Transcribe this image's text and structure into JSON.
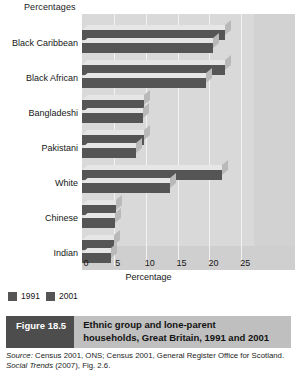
{
  "chart_data": {
    "type": "bar",
    "orientation": "horizontal",
    "title": "Ethnic group and lone-parent households, Great Britain, 1991 and 2001",
    "units_label": "Percentages",
    "xlabel": "Percentage",
    "ylabel": "",
    "xlim": [
      0,
      27
    ],
    "xticks": [
      0,
      5,
      10,
      15,
      20,
      25
    ],
    "xtick_labels": [
      "0",
      "5",
      "10",
      "15",
      "20",
      "25"
    ],
    "grid": true,
    "legend_position": "bottom-left",
    "categories": [
      "Black Caribbean",
      "Black African",
      "Bangladeshi",
      "Pakistani",
      "White",
      "Chinese",
      "Indian"
    ],
    "series": [
      {
        "name": "1991",
        "color": "#555555",
        "values": [
          20.5,
          19.5,
          9.5,
          8.5,
          13.8,
          5.2,
          4.5
        ]
      },
      {
        "name": "2001",
        "color": "#555555",
        "values": [
          22.5,
          22.5,
          9.8,
          9.8,
          22.0,
          5.3,
          5.0
        ]
      }
    ]
  },
  "legend": {
    "items": [
      {
        "label": "1991",
        "color": "#555555"
      },
      {
        "label": "2001",
        "color": "#555555"
      }
    ]
  },
  "caption": {
    "figure_number": "Figure 18.5",
    "title_line1": "Ethnic group and lone-parent",
    "title_line2": "households, Great Britain, 1991 and 2001",
    "source_prefix": "Source:",
    "source_text_1": " Census 2001, ONS; Census 2001, General Register Office for Scotland. ",
    "source_italic": "Social Trends",
    "source_text_2": " (2007), Fig. 2.6."
  },
  "colors": {
    "bar": "#555555",
    "plot_background": "#d9d9d9",
    "caption_bar": "#bfbfbf",
    "figure_number_bg": "#4d4d4d"
  }
}
